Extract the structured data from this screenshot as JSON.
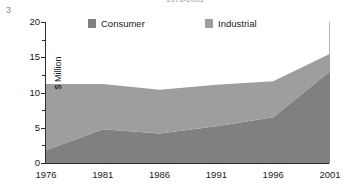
{
  "page_number": "3",
  "legend": {
    "position": "top-inside",
    "items": [
      {
        "label": "Consumer",
        "color": "#808080"
      },
      {
        "label": "Industrial",
        "color": "#9e9e9e"
      }
    ]
  },
  "chart_data": {
    "type": "area",
    "stacked": true,
    "title": "1976-2001",
    "xlabel": "",
    "ylabel": "$ Million",
    "grid": false,
    "legend_position": "top-inside",
    "x": [
      "1976",
      "1981",
      "1986",
      "1991",
      "1996",
      "2001"
    ],
    "categories": [
      "1976",
      "1981",
      "1986",
      "1991",
      "1996",
      "2001"
    ],
    "xlim": [
      1976,
      2001
    ],
    "ylim": [
      0,
      20
    ],
    "y_ticks": [
      "0",
      "5",
      "10",
      "15",
      "20"
    ],
    "y_tick_values": [
      0,
      5,
      10,
      15,
      20
    ],
    "y_minor_tick_values": [
      2.5,
      7.5,
      12.5,
      17.5
    ],
    "series": [
      {
        "name": "Consumer",
        "color": "#808080",
        "values": [
          1.8,
          4.8,
          4.2,
          5.2,
          6.5,
          13.0
        ]
      },
      {
        "name": "Industrial",
        "color": "#9e9e9e",
        "values": [
          9.4,
          6.4,
          6.2,
          5.9,
          5.1,
          2.5
        ]
      }
    ],
    "cumulative_totals": [
      11.2,
      11.2,
      10.4,
      11.1,
      11.6,
      15.5
    ]
  }
}
